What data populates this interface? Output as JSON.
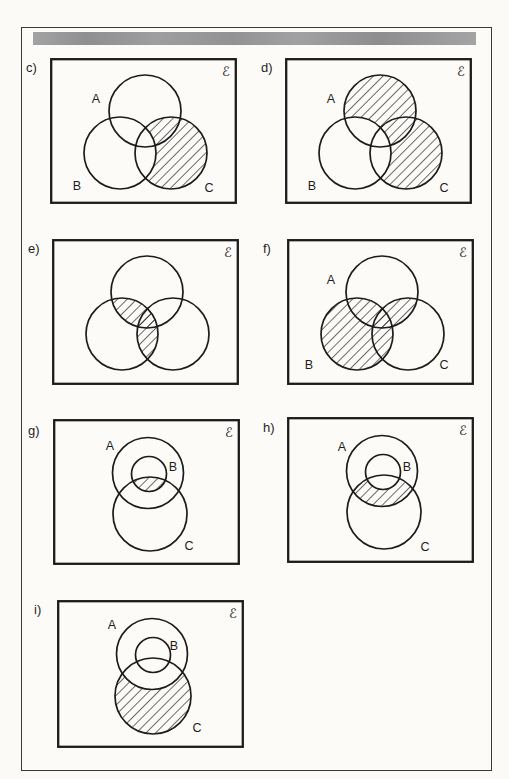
{
  "page": {
    "background_color": "#fbfaf7",
    "border_color": "#3a3a3a",
    "header_bar_color": "#9a9a9a"
  },
  "panels": [
    {
      "key": "c",
      "label": "c)",
      "universal": "ℰ",
      "type": "three_set_venn",
      "sets": {
        "A": "A",
        "B": "B",
        "C": "C"
      },
      "shaded_region": "C ∖ B"
    },
    {
      "key": "d",
      "label": "d)",
      "universal": "ℰ",
      "type": "three_set_venn",
      "sets": {
        "A": "A",
        "B": "B",
        "C": "C"
      },
      "shaded_region": "(A ∪ C) ∖ B"
    },
    {
      "key": "e",
      "label": "e)",
      "universal": "ℰ",
      "type": "three_set_venn",
      "sets": {},
      "shaded_region": "B ∩ (A ∪ C)"
    },
    {
      "key": "f",
      "label": "f)",
      "universal": "ℰ",
      "type": "three_set_venn",
      "sets": {
        "A": "A",
        "B": "B",
        "C": "C"
      },
      "shaded_region": "B ∪ (A ∩ C)"
    },
    {
      "key": "g",
      "label": "g)",
      "universal": "ℰ",
      "type": "subset_venn",
      "sets": {
        "A": "A",
        "B": "B",
        "C": "C"
      },
      "shaded_region": "B ∩ C"
    },
    {
      "key": "h",
      "label": "h)",
      "universal": "ℰ",
      "type": "subset_venn",
      "sets": {
        "A": "A",
        "B": "B",
        "C": "C"
      },
      "shaded_region": "(A ∩ C) ∖ B"
    },
    {
      "key": "i",
      "label": "i)",
      "universal": "ℰ",
      "type": "subset_venn",
      "sets": {
        "A": "A",
        "B": "B",
        "C": "C"
      },
      "shaded_region": "C ∖ A"
    }
  ]
}
